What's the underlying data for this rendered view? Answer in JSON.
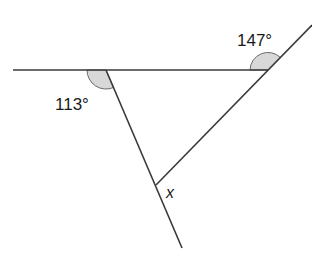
{
  "diagram": {
    "type": "geometry-angles",
    "angles": [
      {
        "label": "113°",
        "vertex": "left",
        "position": "below-left of horizontal line"
      },
      {
        "label": "147°",
        "vertex": "right",
        "position": "above-left of horizontal line"
      }
    ],
    "unknown": {
      "label": "x",
      "vertex": "bottom"
    },
    "colors": {
      "line": "#3a3a3a",
      "arc_fill": "#d8d8d8",
      "text": "#1a1a1a"
    }
  }
}
